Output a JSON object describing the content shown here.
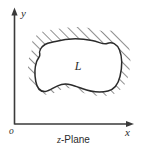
{
  "figure": {
    "caption_variable": "z",
    "caption_rest": "-Plane",
    "caption_full": "z-Plane",
    "axes": {
      "x_label": "x",
      "y_label": "y",
      "origin_label": "o"
    },
    "region": {
      "label": "L",
      "description": "closed contour region",
      "fill_color": "#ffffff",
      "stroke_color": "#2b2b2b"
    },
    "hatching": {
      "angle_degrees": 45,
      "color": "#3a3a3a",
      "band_width_px": 12
    },
    "colors": {
      "background": "#ffffff",
      "ink": "#2b2b2b",
      "axis": "#3a3a3a"
    }
  }
}
